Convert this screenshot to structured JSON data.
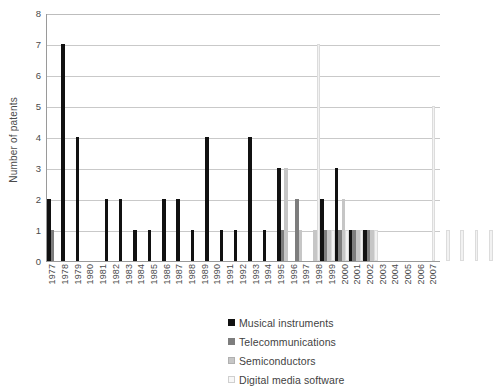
{
  "chart_data": {
    "type": "bar",
    "title": "",
    "xlabel": "",
    "ylabel": "Number of patents",
    "ylim": [
      0,
      8
    ],
    "yticks": [
      0,
      1,
      2,
      3,
      4,
      5,
      6,
      7,
      8
    ],
    "grid": true,
    "legend_position": "bottom-right",
    "categories": [
      "1977",
      "1978",
      "1979",
      "1980",
      "1981",
      "1982",
      "1983",
      "1984",
      "1985",
      "1986",
      "1987",
      "1988",
      "1989",
      "1990",
      "1991",
      "1992",
      "1993",
      "1994",
      "1995",
      "1996",
      "1997",
      "1998",
      "1999",
      "2000",
      "2001",
      "2002",
      "2003",
      "2004",
      "2005",
      "2006",
      "2007"
    ],
    "series": [
      {
        "name": "Musical instruments",
        "color": "#111111",
        "values": [
          2,
          7,
          4,
          0,
          2,
          2,
          1,
          1,
          2,
          2,
          1,
          4,
          1,
          1,
          4,
          1,
          3,
          0,
          0,
          2,
          3,
          1,
          1,
          0,
          0,
          0,
          0,
          0,
          0,
          0,
          0
        ]
      },
      {
        "name": "Telecommunications",
        "color": "#7d7d7d",
        "values": [
          1,
          0,
          0,
          0,
          0,
          0,
          0,
          0,
          0,
          0,
          0,
          0,
          0,
          0,
          0,
          0,
          1,
          2,
          0,
          1,
          1,
          1,
          1,
          0,
          0,
          0,
          0,
          0,
          0,
          0,
          0
        ]
      },
      {
        "name": "Semiconductors",
        "color": "#c6c6c6",
        "values": [
          0,
          0,
          0,
          0,
          0,
          0,
          0,
          0,
          0,
          0,
          0,
          0,
          0,
          0,
          0,
          0,
          3,
          1,
          1,
          1,
          2,
          1,
          1,
          0,
          0,
          0,
          0,
          0,
          0,
          0,
          0
        ]
      },
      {
        "name": "Digital media software",
        "color": "#f2f2f2",
        "values": [
          0,
          0,
          0,
          0,
          0,
          0,
          0,
          0,
          0,
          0,
          0,
          0,
          0,
          0,
          0,
          0,
          0,
          0,
          7,
          1,
          1,
          1,
          1,
          0,
          0,
          0,
          5,
          1,
          1,
          1,
          1
        ]
      }
    ]
  },
  "legend": {
    "items": [
      {
        "label": "Musical instruments"
      },
      {
        "label": "Telecommunications"
      },
      {
        "label": "Semiconductors"
      },
      {
        "label": "Digital media software"
      }
    ]
  }
}
